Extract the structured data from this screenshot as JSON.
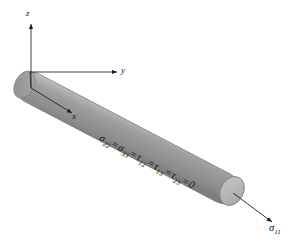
{
  "figure": {
    "name": "uniaxial-stress-cylinder-diagram",
    "background_color": "#ffffff",
    "axes": {
      "z": {
        "label": "z",
        "direction": "up",
        "icon": "arrow-up-icon"
      },
      "y": {
        "label": "y",
        "direction": "right",
        "icon": "arrow-right-icon"
      },
      "x": {
        "label": "x",
        "direction": "down-right-into-page",
        "icon": "arrow-down-right-icon"
      }
    },
    "cylinder": {
      "name": "circular-rod",
      "body_color_light": "#b4b4b4",
      "body_color_mid": "#9b9b9b",
      "body_color_dark": "#7e7e7e",
      "end_cap_color": "#b9b9b9",
      "outline_color": "#6f6f6f",
      "axis_line_color": "#2a2a2a"
    },
    "annotations": {
      "zero_stress_components": {
        "sigma22": "σ",
        "sigma22_sub": "22",
        "eq1": "=",
        "sigma33": "σ",
        "sigma33_sub": "33",
        "eq2": "=",
        "tau12": "τ",
        "tau12_sub": "12",
        "eq3": "=",
        "tau13": "τ",
        "tau13_sub": "13",
        "eq4": "=",
        "tau23": "τ",
        "tau23_sub": "23",
        "eq5": "=",
        "zero": "0",
        "full_text": "σ₂₂ = σ₃₃ = τ₁₂ = τ₁₃ = τ₂₃ = 0"
      },
      "applied_stress": {
        "symbol": "σ",
        "subscript": "11",
        "arrow_icon": "arrow-down-right-icon",
        "full_text": "σ₁₁"
      }
    }
  }
}
